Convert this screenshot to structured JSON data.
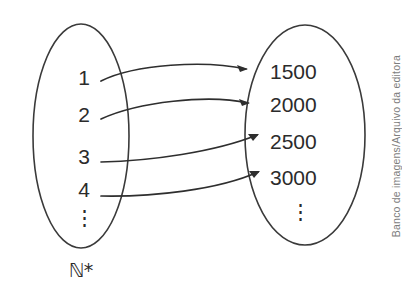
{
  "diagram": {
    "type": "mapping-diagram",
    "domain_set": {
      "name": "domain-ellipse",
      "label": "ℕ*",
      "elements": [
        "1",
        "2",
        "3",
        "4"
      ],
      "continuation": "⋮"
    },
    "codomain_set": {
      "name": "codomain-ellipse",
      "label": "",
      "elements": [
        "1500",
        "2000",
        "2500",
        "3000"
      ],
      "continuation": "⋮"
    },
    "mappings": [
      {
        "from": "1",
        "to": "1500"
      },
      {
        "from": "2",
        "to": "2000"
      },
      {
        "from": "3",
        "to": "2500"
      },
      {
        "from": "4",
        "to": "3000"
      }
    ],
    "colors": {
      "stroke": "#3a3a3a",
      "arrow": "#2e2e2e",
      "text": "#2b2b2b",
      "credit": "#7d7d7d",
      "background": "#ffffff"
    }
  },
  "credit": {
    "text": "Banco de imagens/Arquivo da editora"
  }
}
